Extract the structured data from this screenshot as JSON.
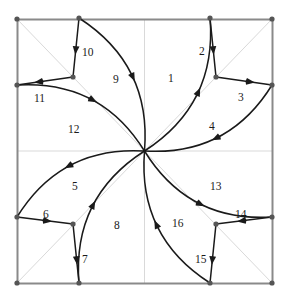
{
  "figure": {
    "title": "",
    "type": "geometric-path-diagram",
    "canvas": {
      "width": 289,
      "height": 298
    },
    "colors": {
      "border": "#8a8a8a",
      "grid": "#d9d9d9",
      "diagonal": "#d9d9d9",
      "path": "#1a1a1a",
      "vertex": "#555555",
      "label": "#1a1a1a",
      "background": "#ffffff"
    },
    "square": {
      "x": 17,
      "y": 19,
      "width": 255,
      "height": 264
    },
    "center": {
      "x": 144.5,
      "y": 151
    },
    "grid_lines": [
      {
        "name": "vertical-midline",
        "x1": 144.5,
        "y1": 19,
        "x2": 144.5,
        "y2": 283
      },
      {
        "name": "horizontal-midline",
        "x1": 17,
        "y1": 151,
        "x2": 272,
        "y2": 151
      },
      {
        "name": "diagonal-main",
        "x1": 17,
        "y1": 19,
        "x2": 272,
        "y2": 283
      },
      {
        "name": "diagonal-anti",
        "x1": 272,
        "y1": 19,
        "x2": 17,
        "y2": 283
      }
    ],
    "vertices": [
      {
        "name": "top-left-corner",
        "x": 17,
        "y": 19
      },
      {
        "name": "top-right-corner",
        "x": 272,
        "y": 19
      },
      {
        "name": "bottom-left-corner",
        "x": 17,
        "y": 283
      },
      {
        "name": "bottom-right-corner",
        "x": 272,
        "y": 283
      },
      {
        "name": "top-edge-left-node",
        "x": 79,
        "y": 18
      },
      {
        "name": "top-edge-right-node",
        "x": 210,
        "y": 18
      },
      {
        "name": "right-edge-top-node",
        "x": 272,
        "y": 85
      },
      {
        "name": "right-edge-bottom-node",
        "x": 272,
        "y": 217
      },
      {
        "name": "bottom-edge-right-node",
        "x": 210,
        "y": 283
      },
      {
        "name": "bottom-edge-left-node",
        "x": 79,
        "y": 283
      },
      {
        "name": "left-edge-bottom-node",
        "x": 17,
        "y": 217
      },
      {
        "name": "left-edge-top-node",
        "x": 17,
        "y": 85
      },
      {
        "name": "inner-node-upper-left",
        "x": 73,
        "y": 77
      },
      {
        "name": "inner-node-upper-right",
        "x": 216,
        "y": 77
      },
      {
        "name": "inner-node-lower-right",
        "x": 216,
        "y": 224
      },
      {
        "name": "inner-node-lower-left",
        "x": 73,
        "y": 224
      }
    ],
    "segments": [
      {
        "id": 1,
        "label": "1",
        "kind": "curve",
        "from": "center",
        "to": "top-edge-right-node",
        "arrow_at": 0.52,
        "label_x": 168,
        "label_y": 73
      },
      {
        "id": 2,
        "label": "2",
        "kind": "line",
        "from": "top-edge-right-node",
        "to": "inner-node-upper-right",
        "arrow_at": 0.55,
        "label_x": 199,
        "label_y": 46
      },
      {
        "id": 3,
        "label": "3",
        "kind": "line",
        "from": "inner-node-upper-right",
        "to": "right-edge-top-node",
        "arrow_at": 0.62,
        "label_x": 238,
        "label_y": 92
      },
      {
        "id": 4,
        "label": "4",
        "kind": "curve",
        "from": "right-edge-top-node",
        "to": "center",
        "arrow_at": 0.52,
        "label_x": 209,
        "label_y": 121
      },
      {
        "id": 5,
        "label": "5",
        "kind": "curve",
        "from": "center",
        "to": "left-edge-bottom-node",
        "arrow_at": 0.52,
        "label_x": 72,
        "label_y": 181
      },
      {
        "id": 6,
        "label": "6",
        "kind": "line",
        "from": "left-edge-bottom-node",
        "to": "inner-node-lower-left",
        "arrow_at": 0.55,
        "label_x": 43,
        "label_y": 209
      },
      {
        "id": 7,
        "label": "7",
        "kind": "line",
        "from": "inner-node-lower-left",
        "to": "bottom-edge-left-node",
        "arrow_at": 0.62,
        "label_x": 82,
        "label_y": 254
      },
      {
        "id": 8,
        "label": "8",
        "kind": "curve",
        "from": "bottom-edge-left-node",
        "to": "center",
        "arrow_at": 0.52,
        "label_x": 114,
        "label_y": 220
      },
      {
        "id": 9,
        "label": "9",
        "kind": "curve",
        "from": "top-edge-left-node",
        "to": "center",
        "arrow_at": 0.52,
        "label_x": 113,
        "label_y": 74
      },
      {
        "id": 10,
        "label": "10",
        "kind": "line",
        "from": "top-edge-left-node",
        "to": "inner-node-upper-left",
        "arrow_at": 0.55,
        "label_x": 82,
        "label_y": 47
      },
      {
        "id": 11,
        "label": "11",
        "kind": "line",
        "from": "inner-node-upper-left",
        "to": "left-edge-top-node",
        "arrow_at": 0.62,
        "label_x": 34,
        "label_y": 93
      },
      {
        "id": 12,
        "label": "12",
        "kind": "curve",
        "from": "left-edge-top-node",
        "to": "center",
        "arrow_at": 0.52,
        "label_x": 68,
        "label_y": 124
      },
      {
        "id": 13,
        "label": "13",
        "kind": "curve",
        "from": "center",
        "to": "right-edge-bottom-node",
        "arrow_at": 0.52,
        "label_x": 210,
        "label_y": 181
      },
      {
        "id": 14,
        "label": "14",
        "kind": "line",
        "from": "right-edge-bottom-node",
        "to": "inner-node-lower-right",
        "arrow_at": 0.55,
        "label_x": 235,
        "label_y": 209
      },
      {
        "id": 15,
        "label": "15",
        "kind": "line",
        "from": "inner-node-lower-right",
        "to": "bottom-edge-right-node",
        "arrow_at": 0.62,
        "label_x": 195,
        "label_y": 254
      },
      {
        "id": 16,
        "label": "16",
        "kind": "curve",
        "from": "bottom-edge-right-node",
        "to": "center",
        "arrow_at": 0.52,
        "label_x": 172,
        "label_y": 218
      }
    ]
  }
}
